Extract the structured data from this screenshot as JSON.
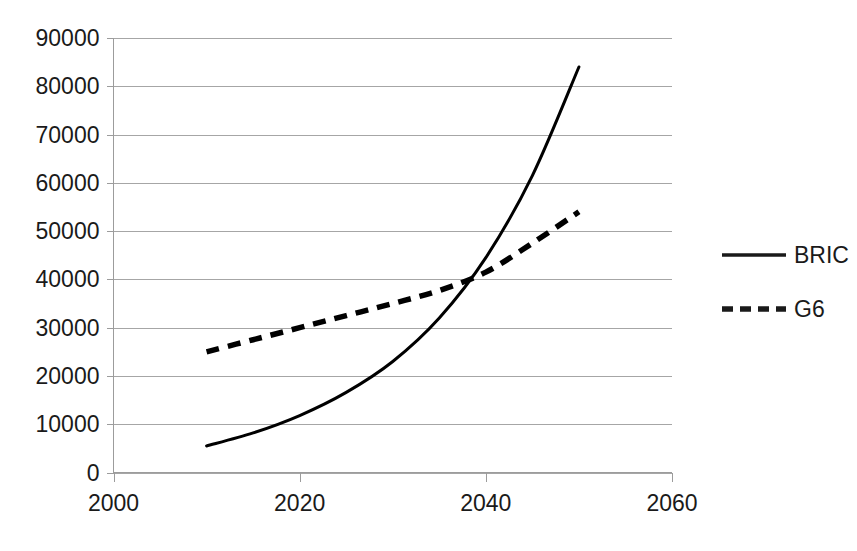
{
  "chart_data": {
    "type": "line",
    "title": "",
    "subtitle": "",
    "xlabel": "",
    "ylabel": "",
    "xlim": [
      2000,
      2060
    ],
    "ylim": [
      0,
      90000
    ],
    "xticks": [
      "2000",
      "2020",
      "2040",
      "2060"
    ],
    "xtick_values": [
      2000,
      2020,
      2040,
      2060
    ],
    "yticks": [
      "0",
      "10000",
      "20000",
      "30000",
      "40000",
      "50000",
      "60000",
      "70000",
      "80000",
      "90000"
    ],
    "ytick_values": [
      0,
      10000,
      20000,
      30000,
      40000,
      50000,
      60000,
      70000,
      80000,
      90000
    ],
    "grid": "horizontal",
    "legend_position": "right",
    "x": [
      2010,
      2015,
      2020,
      2025,
      2030,
      2035,
      2040,
      2045,
      2050
    ],
    "series": [
      {
        "name": "BRIC",
        "style": "solid",
        "color": "#000000",
        "values": [
          5500,
          8200,
          11800,
          16600,
          23000,
          32000,
          44500,
          61500,
          84000
        ]
      },
      {
        "name": "G6",
        "style": "dashed",
        "color": "#000000",
        "values": [
          25000,
          27500,
          30000,
          32500,
          35000,
          37700,
          41500,
          47500,
          54000
        ]
      }
    ],
    "annotations": [
      {
        "name": "crossover",
        "x": 2037,
        "y": 41500,
        "label": ""
      }
    ]
  },
  "legend": {
    "items": [
      {
        "label": "BRIC",
        "style": "solid",
        "swatch_name": "legend-swatch-solid"
      },
      {
        "label": "G6",
        "style": "dashed",
        "swatch_name": "legend-swatch-dashed"
      }
    ]
  },
  "axes": {
    "y_axis_name": "value-axis",
    "x_axis_name": "year-axis"
  },
  "colors": {
    "background": "#ffffff",
    "gridline": "#a6a6a6",
    "axis": "#9c9c9c",
    "series": "#000000",
    "text": "#1a1a1a"
  }
}
